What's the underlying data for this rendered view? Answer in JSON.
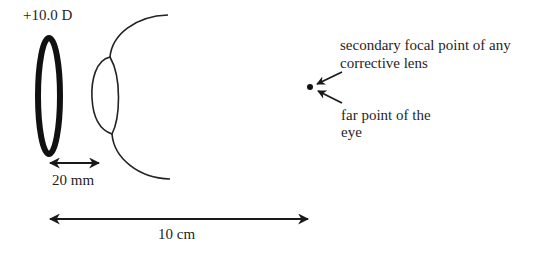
{
  "diagram": {
    "labels": {
      "lens_power": "+10.0 D",
      "vertex_distance": "20 mm",
      "total_distance": "10 cm",
      "focal_point_line1": "secondary focal point of any",
      "focal_point_line2": "corrective lens",
      "far_point_line1": "far point of the",
      "far_point_line2": "eye"
    },
    "elements": {
      "corrective_lens": {
        "shape": "thick-ellipse-ring",
        "power": "+10.0 D"
      },
      "eye": {
        "parts": [
          "cornea-arc-top",
          "crystalline-lens",
          "cornea-arc-bottom"
        ]
      },
      "point": {
        "shape": "dot",
        "meaning": "far point / secondary focal point"
      },
      "dimension_arrows": [
        {
          "label": "20 mm",
          "from": "corrective lens",
          "to": "eye"
        },
        {
          "label": "10 cm",
          "from": "corrective lens",
          "to": "far point"
        }
      ]
    },
    "colors": {
      "stroke": "#1a1a1a",
      "background": "#ffffff"
    }
  }
}
